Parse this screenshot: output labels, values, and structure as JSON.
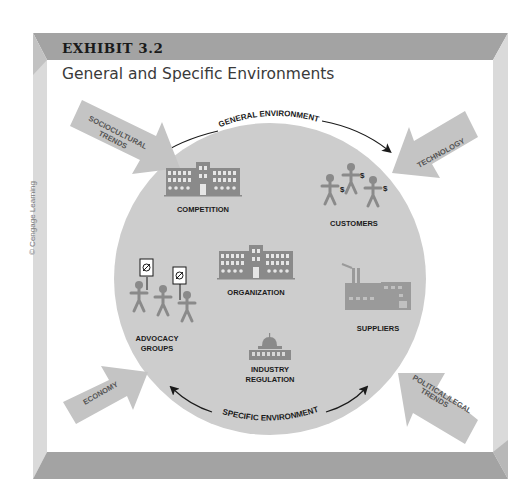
{
  "exhibit": {
    "label": "EXHIBIT 3.2",
    "title": "General and Specific Environments",
    "credit": "© Cengage Learning"
  },
  "diagram": {
    "outer_arc_top": "GENERAL ENVIRONMENT",
    "outer_arc_bottom": "SPECIFIC ENVIRONMENT",
    "center": "ORGANIZATION",
    "specific_elements": [
      {
        "label": "COMPETITION",
        "icon": "building-icon"
      },
      {
        "label": "CUSTOMERS",
        "icon": "people-with-money-icon"
      },
      {
        "label": "SUPPLIERS",
        "icon": "factory-icon"
      },
      {
        "label": "INDUSTRY REGULATION",
        "line1": "INDUSTRY",
        "line2": "REGULATION",
        "icon": "capitol-icon"
      },
      {
        "label": "ADVOCACY GROUPS",
        "line1": "ADVOCACY",
        "line2": "GROUPS",
        "icon": "protesters-icon"
      }
    ],
    "general_forces": [
      {
        "label": "SOCIOCULTURAL TRENDS",
        "line1": "SOCIOCULTURAL",
        "line2": "TRENDS",
        "position": "top-left"
      },
      {
        "label": "TECHNOLOGY",
        "position": "top-right"
      },
      {
        "label": "ECONOMY",
        "position": "bottom-left"
      },
      {
        "label": "POLITICAL/LEGAL TRENDS",
        "line1": "POLITICAL/LEGAL",
        "line2": "TRENDS",
        "position": "bottom-right"
      }
    ]
  },
  "colors": {
    "frame_dark": "#a3a3a3",
    "frame_light": "#d9d9d9",
    "circle": "#cdcdcd",
    "arrow_fill": "#c4c4c4",
    "icon": "#8a8a8a",
    "text": "#1a1a1a"
  }
}
